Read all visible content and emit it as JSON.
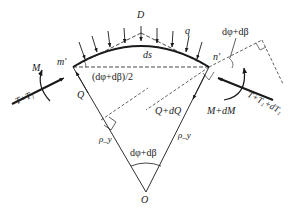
{
  "diagram": {
    "type": "free-body diagram of curved beam element",
    "colors": {
      "stroke": "#1a1a1a",
      "background": "#ffffff"
    },
    "labels": {
      "D": "D",
      "q": "q",
      "ds": "ds",
      "m_prime": "m′",
      "n_prime": "n′",
      "half_angle": "(dφ+dβ)/2",
      "angle_top": "dφ+dβ",
      "angle_bottom": "dφ+dβ",
      "M_left": "M",
      "T_left": "T+T₁",
      "Q_left": "Q",
      "Q_right": "Q+dQ",
      "M_right": "M+dM",
      "T_right": "T+T₁+dT₁",
      "rho_left": "ρ_y",
      "rho_right": "ρ_y",
      "O": "O"
    },
    "points": {
      "m_prime": [
        73,
        67
      ],
      "n_prime": [
        209,
        67
      ],
      "O": [
        146,
        192
      ],
      "D": [
        141,
        33
      ]
    }
  }
}
